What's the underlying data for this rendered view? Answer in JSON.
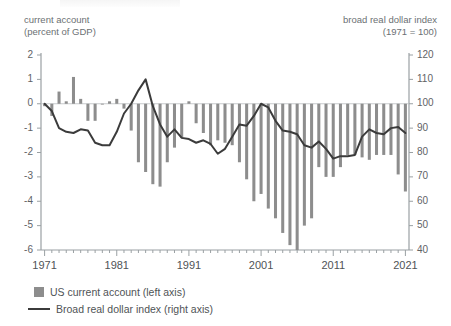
{
  "axis_captions": {
    "left": "current account\n(percent of GDP)",
    "right": "broad real dollar index\n(1971 = 100)"
  },
  "legend": {
    "bars": "US current account (left axis)",
    "line": "Broad real dollar index (right axis)"
  },
  "colors": {
    "bar": "#8d8d8d",
    "line": "#3b3b3b",
    "axis": "#9aa0a3",
    "text": "#5c6063"
  },
  "chart_data": {
    "type": "bar",
    "title": "",
    "xlabel": "",
    "ylabel": "current account (percent of GDP)",
    "y2label": "broad real dollar index (1971 = 100)",
    "ylim": [
      -6,
      2
    ],
    "y2lim": [
      40,
      120
    ],
    "yticks": [
      2,
      1,
      0,
      -1,
      -2,
      -3,
      -4,
      -5,
      -6
    ],
    "y2ticks": [
      120,
      110,
      100,
      90,
      80,
      70,
      60,
      50,
      40
    ],
    "xlim": [
      1971,
      2021
    ],
    "xticks": [
      1971,
      1981,
      1991,
      2001,
      2011,
      2021
    ],
    "xtick_labels": [
      "1971",
      "1981",
      "1991",
      "2001",
      "2011",
      "2021"
    ],
    "minor_xticks": true,
    "grid": false,
    "legend_position": "below",
    "x": [
      1971,
      1972,
      1973,
      1974,
      1975,
      1976,
      1977,
      1978,
      1979,
      1980,
      1981,
      1982,
      1983,
      1984,
      1985,
      1986,
      1987,
      1988,
      1989,
      1990,
      1991,
      1992,
      1993,
      1994,
      1995,
      1996,
      1997,
      1998,
      1999,
      2000,
      2001,
      2002,
      2003,
      2004,
      2005,
      2006,
      2007,
      2008,
      2009,
      2010,
      2011,
      2012,
      2013,
      2014,
      2015,
      2016,
      2017,
      2018,
      2019,
      2020,
      2021
    ],
    "series": [
      {
        "name": "US current account (left axis)",
        "type": "bar",
        "axis": "left",
        "unit": "percent of GDP",
        "values": [
          -0.1,
          -0.5,
          0.5,
          0.1,
          1.1,
          0.2,
          -0.7,
          -0.7,
          0.0,
          0.1,
          0.2,
          -0.2,
          -1.1,
          -2.4,
          -2.8,
          -3.3,
          -3.4,
          -2.4,
          -1.8,
          -1.4,
          0.1,
          -0.8,
          -1.2,
          -1.7,
          -1.5,
          -1.6,
          -1.7,
          -2.4,
          -3.1,
          -4.0,
          -3.7,
          -4.3,
          -4.7,
          -5.3,
          -5.8,
          -6.0,
          -5.0,
          -4.7,
          -2.6,
          -3.0,
          -3.0,
          -2.6,
          -2.1,
          -2.1,
          -2.2,
          -2.3,
          -2.1,
          -2.1,
          -2.1,
          -2.9,
          -3.6
        ]
      },
      {
        "name": "Broad real dollar index (right axis)",
        "type": "line",
        "axis": "right",
        "unit": "index, 1971 = 100",
        "values": [
          100.0,
          97.0,
          90.0,
          88.5,
          88.0,
          89.5,
          89.0,
          84.0,
          83.0,
          83.0,
          88.5,
          96.0,
          100.0,
          105.5,
          110.0,
          99.0,
          91.5,
          86.5,
          89.5,
          86.0,
          85.5,
          84.0,
          85.0,
          83.5,
          79.5,
          81.5,
          86.5,
          91.5,
          91.0,
          95.0,
          100.0,
          98.5,
          93.0,
          89.0,
          88.5,
          87.5,
          83.0,
          82.0,
          84.5,
          81.5,
          77.5,
          78.5,
          78.5,
          79.0,
          86.5,
          89.5,
          88.0,
          87.5,
          90.0,
          90.5,
          88.0
        ]
      }
    ]
  }
}
